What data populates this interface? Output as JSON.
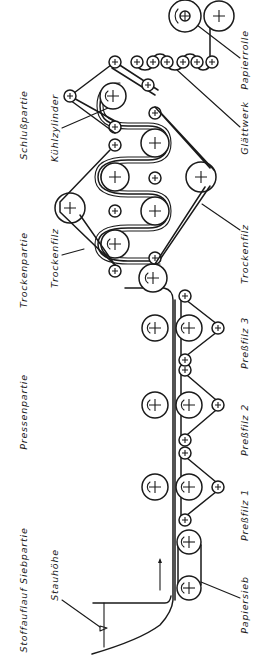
{
  "diagram": {
    "type": "paper-machine-schematic",
    "orientation": "rotated-90-ccw",
    "sections": {
      "headbox_wire": "Stoffauflauf Siebpartie",
      "press": "Pressenpartie",
      "dryer": "Trockenpartie",
      "finishing": "Schlußpartie"
    },
    "labels": {
      "head_height": "Stauhöhe",
      "wire": "Papiersieb",
      "press_felt_1": "Preßfilz 1",
      "press_felt_2": "Preßfilz 2",
      "press_felt_3": "Preßfilz 3",
      "dryer_felt_top": "Trockenfilz",
      "dryer_felt_bottom": "Trockenfilz",
      "cooling_cylinder": "Kühlzylinder",
      "calender": "Glättwerk",
      "paper_roll": "Papierrolle"
    },
    "colors": {
      "line": "#1a1a1a",
      "background": "#ffffff"
    }
  }
}
